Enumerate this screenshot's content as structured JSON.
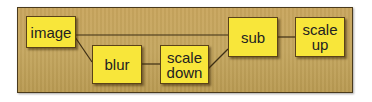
{
  "diagram": {
    "colors": {
      "panel_background": "#c5a760",
      "panel_border": "#4a3a1c",
      "node_fill": "#f8e63a",
      "node_border": "#5a4218",
      "edge": "#3d2e14",
      "text": "#222222"
    },
    "nodes": [
      {
        "id": "image",
        "label": "image"
      },
      {
        "id": "blur",
        "label": "blur"
      },
      {
        "id": "scale_down",
        "label": "scale\ndown"
      },
      {
        "id": "sub",
        "label": "sub"
      },
      {
        "id": "scale_up",
        "label": "scale\nup"
      }
    ],
    "edges": [
      {
        "from": "image",
        "to": "sub"
      },
      {
        "from": "image",
        "to": "blur"
      },
      {
        "from": "blur",
        "to": "scale_down"
      },
      {
        "from": "scale_down",
        "to": "sub"
      },
      {
        "from": "sub",
        "to": "scale_up"
      }
    ]
  }
}
